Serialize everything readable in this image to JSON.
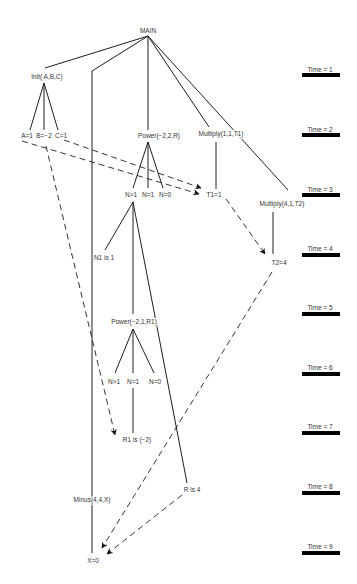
{
  "diagram": {
    "nodes": [
      {
        "id": "main",
        "label": "MAIN"
      },
      {
        "id": "init",
        "label": "Init( A,B,C)"
      },
      {
        "id": "a",
        "label": "A=1"
      },
      {
        "id": "b",
        "label": "B=−2"
      },
      {
        "id": "c",
        "label": "C=1"
      },
      {
        "id": "power1",
        "label": "Power(−2,2,R)"
      },
      {
        "id": "multiply1",
        "label": "Multiply(1,1,T1)"
      },
      {
        "id": "n_gt1_a",
        "label": "N>1"
      },
      {
        "id": "n_eq1_a",
        "label": "N=1"
      },
      {
        "id": "n_eq0_a",
        "label": "N=0"
      },
      {
        "id": "t1",
        "label": "T1=1"
      },
      {
        "id": "multiply2",
        "label": "Multiply(4,1,T2)"
      },
      {
        "id": "n1",
        "label": "N1 is 1"
      },
      {
        "id": "t2",
        "label": "T2=4"
      },
      {
        "id": "power2",
        "label": "Power(−2,1,R1)"
      },
      {
        "id": "n_gt1_b",
        "label": "N>1"
      },
      {
        "id": "n_eq1_b",
        "label": "N=1"
      },
      {
        "id": "n_eq0_b",
        "label": "N=0"
      },
      {
        "id": "r1",
        "label": "R1 is (−2)"
      },
      {
        "id": "r",
        "label": "R is 4"
      },
      {
        "id": "minus",
        "label": "Minus(4,4,X)"
      },
      {
        "id": "x",
        "label": "X=0"
      }
    ],
    "edges": [
      {
        "from": "main",
        "to": "init",
        "style": "solid"
      },
      {
        "from": "main",
        "to": "minus",
        "style": "solid"
      },
      {
        "from": "main",
        "to": "power1",
        "style": "solid"
      },
      {
        "from": "main",
        "to": "multiply1",
        "style": "solid"
      },
      {
        "from": "main",
        "to": "multiply2",
        "style": "solid"
      },
      {
        "from": "init",
        "to": "a",
        "style": "solid"
      },
      {
        "from": "init",
        "to": "b",
        "style": "solid"
      },
      {
        "from": "init",
        "to": "c",
        "style": "solid"
      },
      {
        "from": "power1",
        "to": "n_gt1_a",
        "style": "solid"
      },
      {
        "from": "power1",
        "to": "n_eq1_a",
        "style": "solid"
      },
      {
        "from": "power1",
        "to": "n_eq0_a",
        "style": "solid"
      },
      {
        "from": "multiply1",
        "to": "t1",
        "style": "solid"
      },
      {
        "from": "n_gt1_a",
        "to": "n1",
        "style": "solid"
      },
      {
        "from": "n_gt1_a",
        "to": "power2",
        "style": "solid"
      },
      {
        "from": "n_gt1_a",
        "to": "r",
        "style": "solid"
      },
      {
        "from": "multiply2",
        "to": "t2",
        "style": "solid"
      },
      {
        "from": "power2",
        "to": "n_gt1_b",
        "style": "solid"
      },
      {
        "from": "power2",
        "to": "n_eq1_b",
        "style": "solid"
      },
      {
        "from": "power2",
        "to": "n_eq0_b",
        "style": "solid"
      },
      {
        "from": "n_eq1_b",
        "to": "r1",
        "style": "solid"
      },
      {
        "from": "minus",
        "to": "x",
        "style": "solid"
      },
      {
        "from": "a",
        "to": "t1",
        "style": "dashed-arrow"
      },
      {
        "from": "c",
        "to": "t1",
        "style": "dashed-arrow"
      },
      {
        "from": "b",
        "to": "r1",
        "style": "dashed-arrow"
      },
      {
        "from": "t1",
        "to": "t2",
        "style": "dashed-arrow"
      },
      {
        "from": "t2",
        "to": "x",
        "style": "dashed-arrow"
      },
      {
        "from": "r",
        "to": "x",
        "style": "dashed-arrow"
      }
    ]
  },
  "timeline": {
    "labels": [
      "Time = 1",
      "Time = 2",
      "Time = 3",
      "Time = 4",
      "Time = 5",
      "Time = 6",
      "Time = 7",
      "Time = 8",
      "Time = 9"
    ]
  }
}
